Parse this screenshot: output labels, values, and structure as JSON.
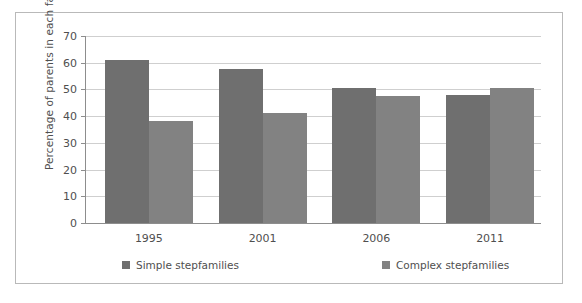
{
  "chart_data": {
    "type": "bar",
    "title": "",
    "subtitle": "",
    "xlabel": "",
    "ylabel": "Percentage of parents in each family type",
    "categories": [
      "1995",
      "2001",
      "2006",
      "2011"
    ],
    "series": [
      {
        "name": "Simple stepfamilies",
        "color": "#6f6f6f",
        "values": [
          61,
          57.5,
          50.7,
          48
        ]
      },
      {
        "name": "Complex stepfamilies",
        "color": "#828282",
        "values": [
          38.3,
          41,
          47.7,
          50.4
        ]
      }
    ],
    "ylim": [
      0,
      70
    ],
    "y_ticks": [
      0,
      10,
      20,
      30,
      40,
      50,
      60,
      70
    ],
    "y_tick_labels": [
      "0",
      "10",
      "20",
      "30",
      "40",
      "50",
      "60",
      "70"
    ],
    "grid": true,
    "legend_position": "bottom"
  },
  "figure": {
    "border_color": "#b9b9b9",
    "background": "#ffffff",
    "axis_color": "#8d8d8d",
    "grid_color": "#cfcfcf",
    "text_color": "#4f4f4f"
  }
}
